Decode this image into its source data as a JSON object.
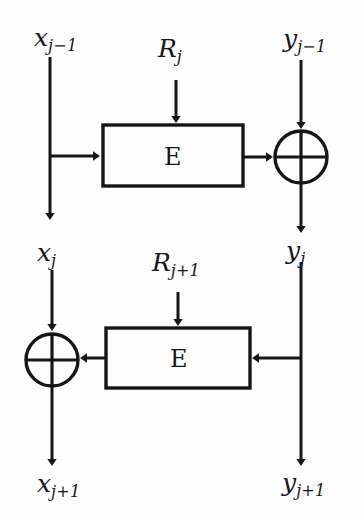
{
  "diagram": {
    "background_color": "#fdfdfd",
    "stroke_color": "#16161a",
    "labels": {
      "x_prev_var": "x",
      "x_prev_sub": "j−1",
      "x_cur_var": "x",
      "x_cur_sub": "j",
      "x_next_var": "x",
      "x_next_sub": "j+1",
      "y_prev_var": "y",
      "y_prev_sub": "j−1",
      "y_cur_var": "y",
      "y_cur_sub": "j",
      "y_next_var": "y",
      "y_next_sub": "j+1",
      "r_top_var": "R",
      "r_top_sub": "j",
      "r_bottom_var": "R",
      "r_bottom_sub": "j+1",
      "encrypt_top": "E",
      "encrypt_bottom": "E",
      "xor_top": "⊕",
      "xor_bottom": "⊕"
    },
    "nodes": {
      "box_top": {
        "x": 103,
        "y": 125,
        "w": 140,
        "h": 61
      },
      "box_bottom": {
        "x": 106,
        "y": 328,
        "w": 144,
        "h": 60
      },
      "xor_top": {
        "cx": 301,
        "cy": 157,
        "r": 26
      },
      "xor_bottom": {
        "cx": 52,
        "cy": 360,
        "r": 26
      }
    }
  }
}
